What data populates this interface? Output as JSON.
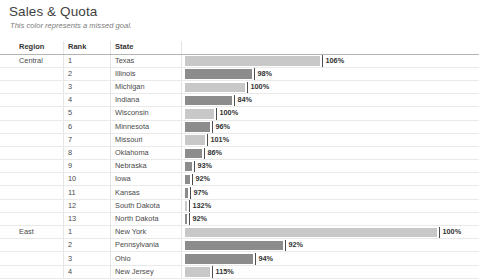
{
  "header": {
    "title": "Sales & Quota",
    "subtitle": "This color represents a missed goal."
  },
  "table": {
    "columns": [
      "Region",
      "Rank",
      "State"
    ]
  },
  "colors": {
    "met_goal": "#c8c8c8",
    "missed_goal": "#8c8c8c",
    "tick": "#4d4d4d",
    "header_rule": "#b4b4b4",
    "row_rule": "#e9e9e9"
  },
  "chart_data": {
    "type": "bar",
    "title": "Sales & Quota",
    "subtitle": "This color represents a missed goal.",
    "xlabel": "",
    "ylabel": "",
    "legend": [
      {
        "label": "Met goal",
        "color": "#c8c8c8"
      },
      {
        "label": "Missed goal",
        "color": "#8c8c8c"
      }
    ],
    "grid": false,
    "columns": [
      "Region",
      "Rank",
      "State"
    ],
    "value_label_suffix": "%",
    "bar_axis_max": 255,
    "rows": [
      {
        "region": "Central",
        "rank": 1,
        "state": "Texas",
        "quota_pct": 106,
        "label": "106%",
        "bar_length": 135,
        "missed": false
      },
      {
        "region": "",
        "rank": 2,
        "state": "Illinois",
        "quota_pct": 98,
        "label": "98%",
        "bar_length": 67,
        "missed": true
      },
      {
        "region": "",
        "rank": 3,
        "state": "Michigan",
        "quota_pct": 100,
        "label": "100%",
        "bar_length": 60,
        "missed": false
      },
      {
        "region": "",
        "rank": 4,
        "state": "Indiana",
        "quota_pct": 84,
        "label": "84%",
        "bar_length": 47,
        "missed": true
      },
      {
        "region": "",
        "rank": 5,
        "state": "Wisconsin",
        "quota_pct": 100,
        "label": "100%",
        "bar_length": 29,
        "missed": false
      },
      {
        "region": "",
        "rank": 6,
        "state": "Minnesota",
        "quota_pct": 96,
        "label": "96%",
        "bar_length": 25,
        "missed": true
      },
      {
        "region": "",
        "rank": 7,
        "state": "Missouri",
        "quota_pct": 101,
        "label": "101%",
        "bar_length": 20,
        "missed": false
      },
      {
        "region": "",
        "rank": 8,
        "state": "Oklahoma",
        "quota_pct": 86,
        "label": "86%",
        "bar_length": 17,
        "missed": true
      },
      {
        "region": "",
        "rank": 9,
        "state": "Nebraska",
        "quota_pct": 93,
        "label": "93%",
        "bar_length": 7,
        "missed": true
      },
      {
        "region": "",
        "rank": 10,
        "state": "Iowa",
        "quota_pct": 92,
        "label": "92%",
        "bar_length": 5,
        "missed": true
      },
      {
        "region": "",
        "rank": 11,
        "state": "Kansas",
        "quota_pct": 97,
        "label": "97%",
        "bar_length": 3,
        "missed": true
      },
      {
        "region": "",
        "rank": 12,
        "state": "South Dakota",
        "quota_pct": 132,
        "label": "132%",
        "bar_length": 2,
        "missed": false
      },
      {
        "region": "",
        "rank": 13,
        "state": "North Dakota",
        "quota_pct": 92,
        "label": "92%",
        "bar_length": 2,
        "missed": true
      },
      {
        "region": "East",
        "rank": 1,
        "state": "New York",
        "quota_pct": 100,
        "label": "100%",
        "bar_length": 252,
        "missed": false
      },
      {
        "region": "",
        "rank": 2,
        "state": "Pennsylvania",
        "quota_pct": 92,
        "label": "92%",
        "bar_length": 98,
        "missed": true
      },
      {
        "region": "",
        "rank": 3,
        "state": "Ohio",
        "quota_pct": 94,
        "label": "94%",
        "bar_length": 68,
        "missed": true
      },
      {
        "region": "",
        "rank": 4,
        "state": "New Jersey",
        "quota_pct": 115,
        "label": "115%",
        "bar_length": 25,
        "missed": false
      }
    ]
  }
}
